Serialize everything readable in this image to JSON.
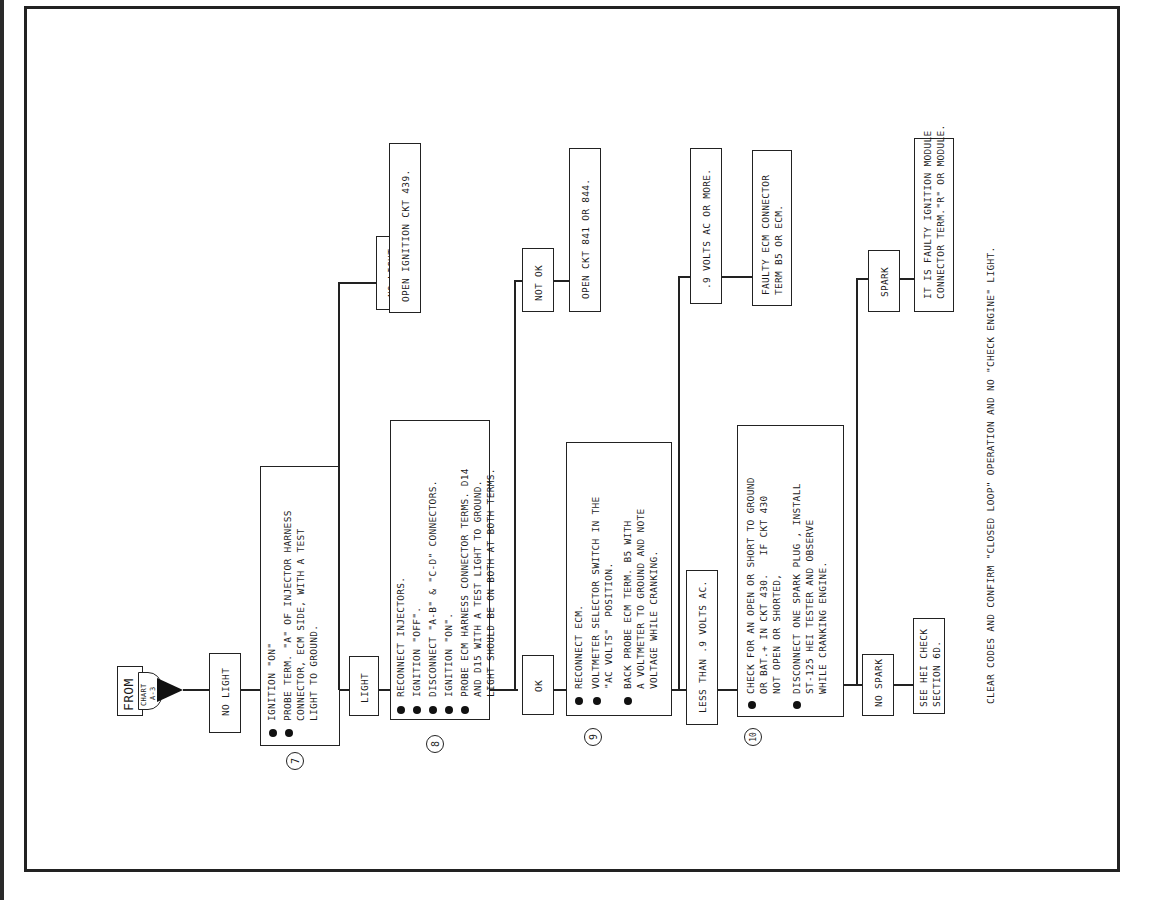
{
  "start": {
    "from_label": "FROM",
    "chart_label": "CHART",
    "chart_ref": "A-3"
  },
  "step7": {
    "number": "7",
    "condition_in": "NO LIGHT",
    "instructions": [
      "IGNITION \"ON\"",
      "PROBE TERM. \"A\" OF INJECTOR HARNESS\nCONNECTOR, ECM SIDE, WITH A TEST\nLIGHT TO GROUND."
    ],
    "branch_no": {
      "label": "NO LIGHT",
      "result": "OPEN IGNITION CKT 439."
    },
    "branch_yes": {
      "label": "LIGHT"
    }
  },
  "step8": {
    "number": "8",
    "instructions": [
      "RECONNECT INJECTORS.",
      "IGNITION \"OFF\".",
      "DISCONNECT \"A-B\" & \"C-D\" CONNECTORS.",
      "IGNITION \"ON\".",
      "PROBE ECM HARNESS CONNECTOR TERMS. D14\nAND D15 WITH A TEST LIGHT TO GROUND.\nLIGHT SHOULD BE ON BOTH AT BOTH TERMS."
    ],
    "branch_no": {
      "label": "NOT OK",
      "result": "OPEN CKT 841 OR 844."
    },
    "branch_yes": {
      "label": "OK"
    }
  },
  "step9": {
    "number": "9",
    "instructions": [
      "RECONNECT ECM.",
      "VOLTMETER SELECTOR SWITCH IN THE\n\"AC VOLTS\"  POSITION.",
      "BACK PROBE ECM TERM. B5 WITH\nA VOLTMETER TO GROUND AND NOTE\nVOLTAGE WHILE CRANKING."
    ],
    "branch_high": {
      "label": ".9 VOLTS AC OR MORE.",
      "result": "FAULTY ECM CONNECTOR\nTERM B5 OR ECM."
    },
    "branch_low": {
      "label": "LESS THAN .9 VOLTS AC."
    }
  },
  "step10": {
    "number": "10",
    "instructions": [
      "CHECK FOR AN OPEN OR SHORT TO GROUND\nOR BAT.+ IN CKT 430.   IF CKT 430\nNOT OPEN OR SHORTED,",
      "DISCONNECT ONE SPARK PLUG , INSTALL\nST-125 HEI TESTER AND OBSERVE\nWHILE CRANKING ENGINE."
    ],
    "branch_spark": {
      "label": "SPARK",
      "result": "IT IS FAULTY IGNITION MODULE\nCONNECTOR TERM.\"R\" OR MODULE."
    },
    "branch_no_spark": {
      "label": "NO SPARK",
      "result": "SEE HEI CHECK\nSECTION 6D."
    }
  },
  "footer_note": "CLEAR CODES AND CONFIRM \"CLOSED LOOP\" OPERATION AND NO \"CHECK ENGINE\" LIGHT."
}
